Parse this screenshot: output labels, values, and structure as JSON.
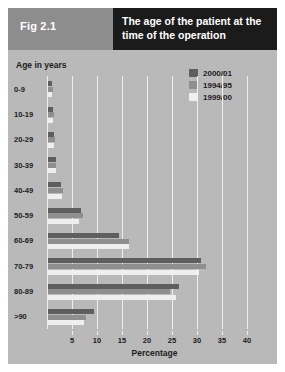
{
  "header": {
    "figure_label": "Fig 2.1",
    "title": "The age of the patient at the time of the operation",
    "left_bg": "#8d8d8d",
    "right_bg": "#1b1b1b"
  },
  "card": {
    "background": "#b9b9b9"
  },
  "chart_data": {
    "type": "bar",
    "orientation": "horizontal",
    "title": "The age of the patient at the time of the operation",
    "xlabel": "Percentage",
    "ylabel": "Age in years",
    "xlim": [
      0,
      43
    ],
    "xticks": [
      5,
      10,
      15,
      20,
      25,
      30,
      35,
      40
    ],
    "grid": true,
    "legend_position": "top-right",
    "categories": [
      "0-9",
      "10-19",
      "20-29",
      "30-39",
      "40-49",
      "50-59",
      "60-69",
      "70-79",
      "80-89",
      ">90"
    ],
    "series": [
      {
        "name": "2000/01",
        "color": "#5e5e5e",
        "values": [
          0.8,
          1.0,
          1.2,
          1.5,
          2.6,
          6.6,
          14.2,
          30.6,
          26.2,
          9.2
        ]
      },
      {
        "name": "1994/95",
        "color": "#8f8f8f",
        "values": [
          0.9,
          1.1,
          1.3,
          1.6,
          3.0,
          7.0,
          16.2,
          31.6,
          24.4,
          7.6
        ]
      },
      {
        "name": "1999/00",
        "color": "#efefef",
        "values": [
          0.8,
          1.0,
          1.2,
          1.5,
          2.8,
          6.2,
          16.2,
          30.2,
          25.6,
          7.2
        ]
      }
    ]
  }
}
